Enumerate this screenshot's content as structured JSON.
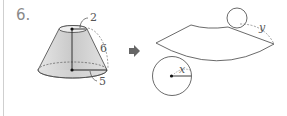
{
  "problem": {
    "number": "6.",
    "frustum": {
      "top_radius_label": "2",
      "slant_label": "6",
      "bottom_radius_label": "5"
    },
    "net": {
      "small_circle_radius_label": "x",
      "arc_label": "y"
    },
    "arrow_icon": "right-arrow-icon"
  }
}
